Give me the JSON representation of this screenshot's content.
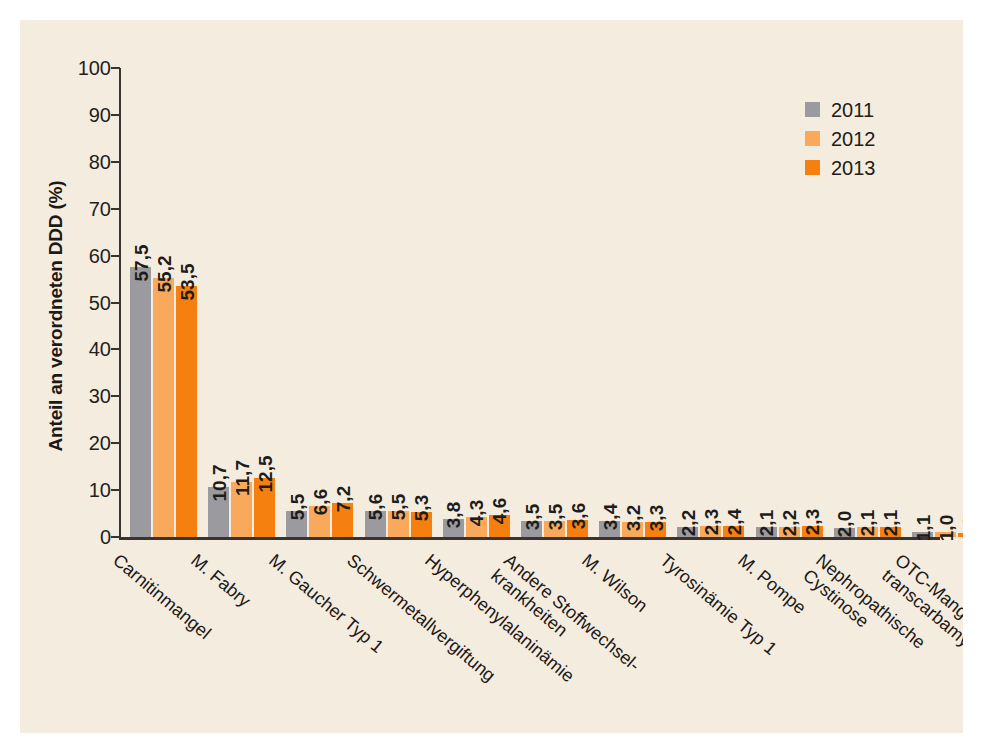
{
  "chart_data": {
    "type": "bar",
    "title": "",
    "xlabel": "",
    "ylabel": "Anteil an verordneten DDD (%)",
    "ylim": [
      0,
      100
    ],
    "yticks": [
      0,
      10,
      20,
      30,
      40,
      50,
      60,
      70,
      80,
      90,
      100
    ],
    "ytick_labels": [
      "0",
      "10",
      "20",
      "30",
      "40",
      "50",
      "60",
      "70",
      "80",
      "90",
      "100"
    ],
    "grid": false,
    "legend_position": "top-right",
    "decimal_separator": ",",
    "categories": [
      "Carnitinmangel",
      "M. Fabry",
      "M. Gaucher Typ 1",
      "Schwermetallvergiftung",
      "Hyperphenylalaninämie",
      "Andere Stoffwechsel-krankheiten",
      "M. Wilson",
      "Tyrosinämie Typ 1",
      "M. Pompe",
      "Nephropathische Cystinose",
      "OTC-Mangel (Ornithin-transcarbamylase)"
    ],
    "category_lines": [
      [
        "Carnitinmangel"
      ],
      [
        "M. Fabry"
      ],
      [
        "M. Gaucher Typ 1"
      ],
      [
        "Schwermetallvergiftung"
      ],
      [
        "Hyperphenylalaninämie"
      ],
      [
        "Andere Stoffwechsel-",
        "krankheiten"
      ],
      [
        "M. Wilson"
      ],
      [
        "Tyrosinämie Typ 1"
      ],
      [
        "M. Pompe"
      ],
      [
        "Nephropathische",
        "Cystinose"
      ],
      [
        "OTC-Mangel (Ornithin-",
        "transcarbamylase)"
      ]
    ],
    "series": [
      {
        "name": "2011",
        "color": "#9b9a9e",
        "values": [
          57.5,
          10.7,
          5.5,
          5.6,
          3.8,
          3.5,
          3.4,
          2.2,
          2.1,
          2.0,
          1.1
        ],
        "labels": [
          "57,5",
          "10,7",
          "5,5",
          "5,6",
          "3,8",
          "3,5",
          "3,4",
          "2,2",
          "2,1",
          "2,0",
          "1,1"
        ]
      },
      {
        "name": "2012",
        "color": "#f9a95c",
        "values": [
          55.2,
          11.7,
          6.6,
          5.5,
          4.3,
          3.5,
          3.2,
          2.3,
          2.2,
          2.1,
          1.0
        ],
        "labels": [
          "55,2",
          "11,7",
          "6,6",
          "5,5",
          "4,3",
          "3,5",
          "3,2",
          "2,3",
          "2,2",
          "2,1",
          "1,0"
        ]
      },
      {
        "name": "2013",
        "color": "#f5800f",
        "values": [
          53.5,
          12.5,
          7.2,
          5.3,
          4.6,
          3.6,
          3.3,
          2.4,
          2.3,
          2.1,
          0.9
        ],
        "labels": [
          "53,5",
          "12,5",
          "7,2",
          "5,3",
          "4,6",
          "3,6",
          "3,3",
          "2,4",
          "2,3",
          "2,1",
          "0,9"
        ]
      }
    ]
  },
  "legend": {
    "items": [
      {
        "label": "2011",
        "color": "#9b9a9e"
      },
      {
        "label": "2012",
        "color": "#f9a95c"
      },
      {
        "label": "2013",
        "color": "#f5800f"
      }
    ]
  },
  "colors": {
    "background": "#f5ece0",
    "page": "#ffffff",
    "axis": "#3a3430",
    "text": "#1c1916",
    "series_2011": "#9b9a9e",
    "series_2012": "#f9a95c",
    "series_2013": "#f5800f"
  }
}
